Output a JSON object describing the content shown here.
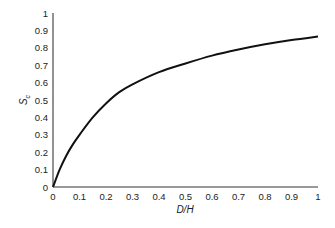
{
  "chart_data": {
    "type": "line",
    "title": "",
    "xlabel": "D/H",
    "ylabel": "S_c",
    "ylabel_main": "S",
    "ylabel_sub": "c",
    "xlim": [
      0,
      1
    ],
    "ylim": [
      0,
      1
    ],
    "grid": false,
    "legend": null,
    "x_ticks": [
      "0",
      "0.1",
      "0.2",
      "0.3",
      "0.4",
      "0.5",
      "0.6",
      "0.7",
      "0.8",
      "0.9",
      "1"
    ],
    "y_ticks": [
      "0",
      "0.1",
      "0.2",
      "0.3",
      "0.4",
      "0.5",
      "0.6",
      "0.7",
      "0.8",
      "0.9",
      "1"
    ],
    "series": [
      {
        "name": "S_c",
        "color": "#111111",
        "x": [
          0,
          0.025,
          0.05,
          0.075,
          0.1,
          0.15,
          0.2,
          0.25,
          0.3,
          0.4,
          0.5,
          0.6,
          0.7,
          0.8,
          0.9,
          1.0
        ],
        "values": [
          0,
          0.1,
          0.18,
          0.245,
          0.3,
          0.4,
          0.48,
          0.545,
          0.59,
          0.66,
          0.71,
          0.755,
          0.79,
          0.82,
          0.845,
          0.865
        ]
      }
    ]
  },
  "colors": {
    "axis": "#777777",
    "curve": "#111111",
    "text": "#222222"
  }
}
